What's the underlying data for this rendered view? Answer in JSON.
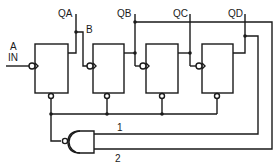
{
  "diagram": {
    "type": "circuit-schematic",
    "input_label_top": "A",
    "input_label_bottom": "IN",
    "flip_flops": [
      {
        "id": "FF1",
        "output": "QA"
      },
      {
        "id": "FF2",
        "output": "QB"
      },
      {
        "id": "FF3",
        "output": "QC"
      },
      {
        "id": "FF4",
        "output": "QD"
      }
    ],
    "labels": {
      "qa": "QA",
      "qb": "QB",
      "qc": "QC",
      "qd": "QD",
      "b": "B",
      "wire1": "1",
      "wire2": "2"
    },
    "gate": {
      "type": "NAND",
      "inputs": [
        "1",
        "2"
      ]
    },
    "colors": {
      "line": "#1a1a1a",
      "background": "#ffffff"
    }
  }
}
